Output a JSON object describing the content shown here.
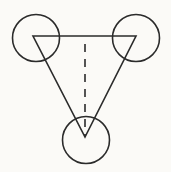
{
  "figure": {
    "title": "Three circles joined by a triangle with a dashed median",
    "type": "geometric-line-diagram",
    "width": 171,
    "height": 172,
    "background_color": "#fbfaf7",
    "stroke_color": "#2b2b2b",
    "stroke_width": 1.6
  },
  "shapes": {
    "circles": [
      {
        "name": "top-left-circle",
        "cx": 36,
        "cy": 38,
        "r": 23.5,
        "fill": "none",
        "stroke": "#2b2b2b"
      },
      {
        "name": "top-right-circle",
        "cx": 136,
        "cy": 38,
        "r": 23.5,
        "fill": "none",
        "stroke": "#2b2b2b"
      },
      {
        "name": "bottom-circle",
        "cx": 86,
        "cy": 140,
        "r": 23.5,
        "fill": "none",
        "stroke": "#2b2b2b"
      }
    ],
    "triangle": {
      "name": "connecting-triangle",
      "points": "33,36 136,36 85,137",
      "vertices": [
        {
          "label": "A",
          "x": 33,
          "y": 36
        },
        {
          "label": "B",
          "x": 136,
          "y": 36
        },
        {
          "label": "C",
          "x": 85,
          "y": 137
        }
      ],
      "fill": "none",
      "stroke": "#2b2b2b"
    },
    "dashed_line": {
      "name": "vertical-dashed-median",
      "x1": 85,
      "y1": 44,
      "x2": 85,
      "y2": 137,
      "stroke": "#2b2b2b",
      "dash_pattern": "8 7"
    }
  },
  "labels": {
    "visible_text": []
  }
}
